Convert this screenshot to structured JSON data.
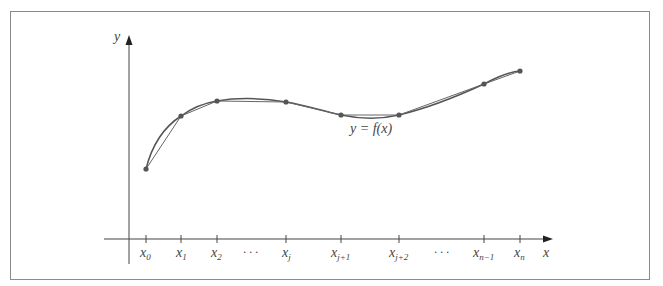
{
  "figure": {
    "type": "diagram",
    "axes": {
      "x_label": "x",
      "y_label": "y"
    },
    "curve_label": "y = f(x)",
    "partition_labels": [
      {
        "base": "x",
        "sub": "0"
      },
      {
        "base": "x",
        "sub": "1"
      },
      {
        "base": "x",
        "sub": "2"
      },
      {
        "base": "x",
        "sub": "j"
      },
      {
        "base": "x",
        "sub": "j+1"
      },
      {
        "base": "x",
        "sub": "j+2"
      },
      {
        "base": "x",
        "sub": "n−1"
      },
      {
        "base": "x",
        "sub": "n"
      }
    ],
    "ellipsis": "· · ·",
    "colors": {
      "curve": "#555555",
      "axis": "#444444",
      "points": "#555555",
      "frame": "#8a8a8a"
    }
  }
}
